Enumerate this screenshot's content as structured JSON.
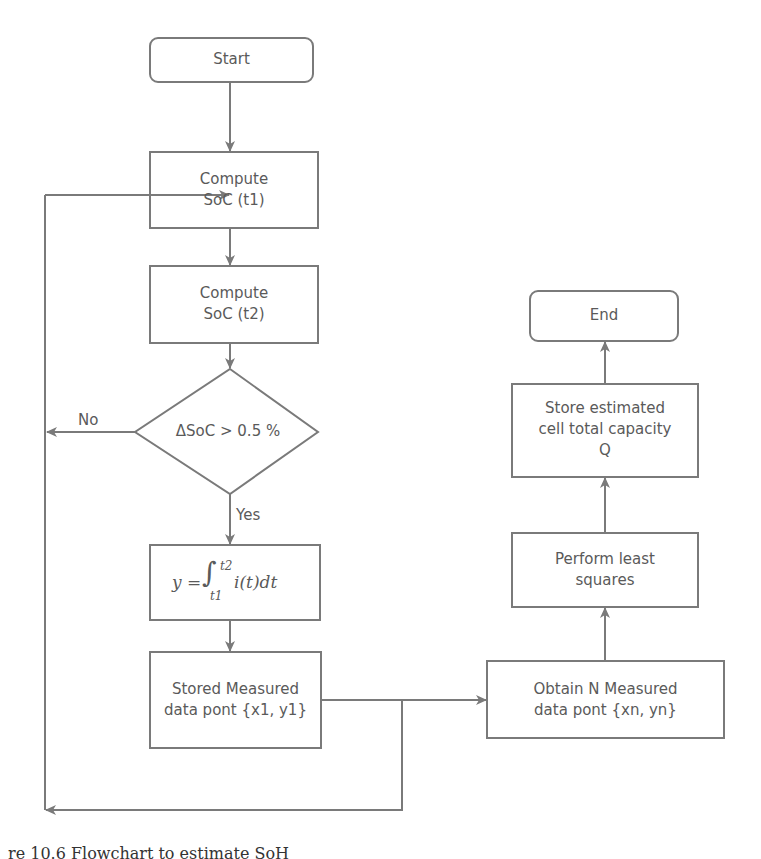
{
  "diagram": {
    "type": "flowchart",
    "nodes": {
      "start": {
        "label": "Start",
        "shape": "rounded-rect"
      },
      "compute_t1": {
        "line1": "Compute",
        "line2": "SoC (t1)",
        "shape": "rect"
      },
      "compute_t2": {
        "line1": "Compute",
        "line2": "SoC (t2)",
        "shape": "rect"
      },
      "decision": {
        "label": "ΔSoC > 0.5 %",
        "shape": "diamond"
      },
      "integral": {
        "lhs": "y =",
        "integral": "∫",
        "upper": "t2",
        "lower": "t1",
        "body": "i(t)dt",
        "shape": "rect"
      },
      "stored": {
        "line1": "Stored Measured",
        "line2": "data pont {x1, y1}",
        "shape": "rect"
      },
      "obtain": {
        "line1": "Obtain N Measured",
        "line2": "data pont {xn, yn}",
        "shape": "rect"
      },
      "least_squares": {
        "line1": "Perform least",
        "line2": "squares",
        "shape": "rect"
      },
      "store_capacity": {
        "line1": "Store estimated",
        "line2": "cell total capacity",
        "line3": "Q",
        "shape": "rect"
      },
      "end": {
        "label": "End",
        "shape": "rounded-rect"
      }
    },
    "edge_labels": {
      "no": "No",
      "yes": "Yes"
    },
    "edges": [
      [
        "start",
        "compute_t1"
      ],
      [
        "compute_t1",
        "compute_t2"
      ],
      [
        "compute_t2",
        "decision"
      ],
      [
        "decision",
        "integral",
        "Yes"
      ],
      [
        "decision",
        "loop-back",
        "No"
      ],
      [
        "integral",
        "stored"
      ],
      [
        "stored",
        "obtain"
      ],
      [
        "stored",
        "loop-back"
      ],
      [
        "obtain",
        "least_squares"
      ],
      [
        "least_squares",
        "store_capacity"
      ],
      [
        "store_capacity",
        "end"
      ]
    ],
    "colors": {
      "stroke": "#7a7a7a",
      "text": "#5a5a5a",
      "background": "#ffffff"
    }
  },
  "caption": "re 10.6  Flowchart to estimate SoH"
}
